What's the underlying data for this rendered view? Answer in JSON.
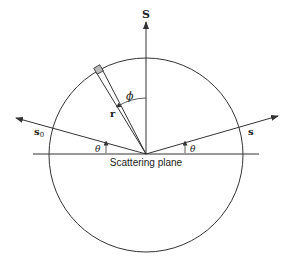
{
  "diagram": {
    "labels": {
      "normal_vector": "S",
      "incident_vector": "s",
      "incident_subscript": "0",
      "scattered_vector": "s",
      "radius": "r",
      "azimuth_angle": "ϕ",
      "theta_left": "θ",
      "theta_right": "θ",
      "plane": "Scattering plane"
    },
    "colors": {
      "stroke": "#333333",
      "background": "#ffffff"
    }
  }
}
